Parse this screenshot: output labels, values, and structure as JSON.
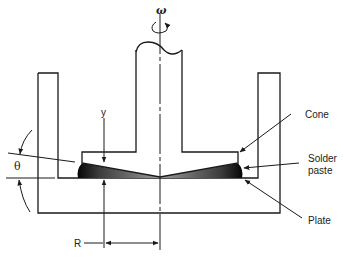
{
  "diagram": {
    "type": "cone-and-plate rheometer schematic",
    "labels": {
      "omega": "ω",
      "y": "y",
      "theta": "θ",
      "R": "R",
      "cone": "Cone",
      "solder_line1": "Solder",
      "solder_line2": "paste",
      "plate": "Plate"
    },
    "colors": {
      "line": "#1a1a1a",
      "paste": "#111111",
      "background": "#ffffff"
    }
  }
}
